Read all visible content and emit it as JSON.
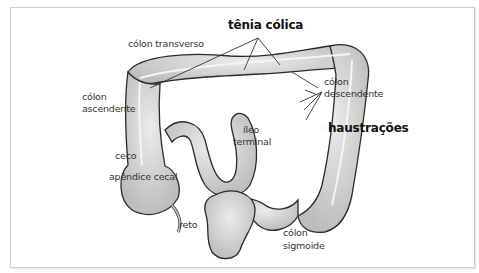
{
  "diagram": {
    "labels": {
      "tenia_colica": "tênia cólica",
      "colon_transverso": "cólon transverso",
      "colon_ascendente_1": "cólon",
      "colon_ascendente_2": "ascendente",
      "colon_descendente_1": "cólon",
      "colon_descendente_2": "descendente",
      "haustracoes": "haustrações",
      "ileo_1": "íleo",
      "ileo_2": "terminal",
      "ceco": "ceco",
      "apendice": "apêndice cecal",
      "reto": "reto",
      "sigmoide_1": "cólon",
      "sigmoide_2": "sigmoide"
    },
    "colors": {
      "organ_fill": "#d9d9d9",
      "organ_stroke": "#2a2a2a",
      "band": "#f2f2f2",
      "frame": "#cfcfcf"
    }
  }
}
